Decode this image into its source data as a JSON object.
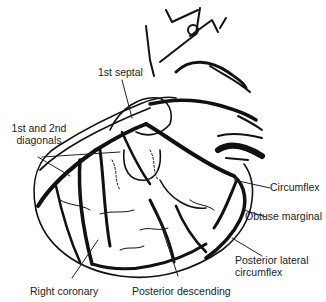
{
  "diagram": {
    "labels": {
      "first_septal": "1st septal",
      "diagonals_line1": "1st and 2nd",
      "diagonals_line2": "diagonals",
      "circumflex": "Circumflex",
      "obtuse_marginal": "Obtuse marginal",
      "posterior_lateral_line1": "Posterior lateral",
      "posterior_lateral_line2": "circumflex",
      "right_coronary": "Right coronary",
      "posterior_descending": "Posterior descending"
    },
    "colors": {
      "ink": "#111111",
      "label_text": "#222222",
      "background": "#ffffff"
    }
  }
}
